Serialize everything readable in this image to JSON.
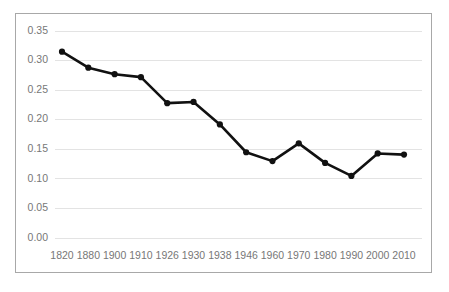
{
  "chart_data": {
    "type": "line",
    "title": "",
    "subtitle": "",
    "xlabel": "",
    "ylabel": "",
    "categories": [
      "1820",
      "1880",
      "1900",
      "1910",
      "1926",
      "1930",
      "1938",
      "1946",
      "1960",
      "1970",
      "1980",
      "1990",
      "2000",
      "2010"
    ],
    "values": [
      0.315,
      0.288,
      0.277,
      0.272,
      0.228,
      0.23,
      0.192,
      0.145,
      0.13,
      0.16,
      0.127,
      0.105,
      0.143,
      0.141
    ],
    "series": [
      {
        "name": "",
        "values": [
          0.315,
          0.288,
          0.277,
          0.272,
          0.228,
          0.23,
          0.192,
          0.145,
          0.13,
          0.16,
          0.127,
          0.105,
          0.143,
          0.141
        ]
      }
    ],
    "ylim": [
      0.0,
      0.35
    ],
    "ytick_labels": [
      "0.00",
      "0.05",
      "0.10",
      "0.15",
      "0.20",
      "0.25",
      "0.30",
      "0.35"
    ],
    "ytick_values": [
      0.0,
      0.05,
      0.1,
      0.15,
      0.2,
      0.25,
      0.3,
      0.35
    ],
    "grid": "horizontal",
    "legend": "none",
    "annotations": [],
    "colors": {
      "line": "#111111",
      "marker": "#111111",
      "gridline": "#e3e3e3",
      "frame_border": "#a8a8a8",
      "tick_label": "#777777",
      "background": "#ffffff"
    }
  }
}
